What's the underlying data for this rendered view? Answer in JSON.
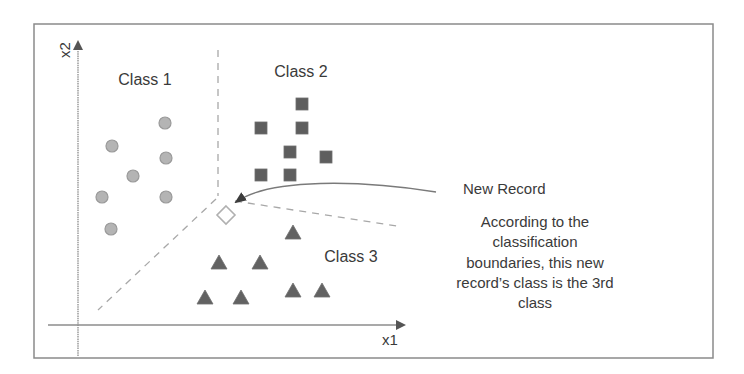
{
  "figure": {
    "type": "classification-scatter-diagram",
    "axes": {
      "x_label": "x1",
      "y_label": "x2"
    },
    "labels": {
      "class1": "Class 1",
      "class2": "Class 2",
      "class3": "Class 3",
      "new_record": "New Record"
    },
    "annotation_lines": [
      "According to the",
      "classification",
      "boundaries, this new",
      "record’s class is the 3rd",
      "class"
    ],
    "colors": {
      "frame": "#8a8a8a",
      "axis": "#8c8c8c",
      "boundary": "#a8a8a8",
      "class1_fill": "#b4b4b4",
      "class1_stroke": "#9a9a9a",
      "class2_fill": "#5e5e5e",
      "class3_fill": "#626262",
      "new_record_stroke": "#b0b0b0",
      "text": "#3a3a3a"
    },
    "points": {
      "class1_circles": [
        [
          165,
          123
        ],
        [
          112,
          146
        ],
        [
          166,
          158
        ],
        [
          133,
          176
        ],
        [
          102,
          197
        ],
        [
          166,
          197
        ],
        [
          111,
          229
        ]
      ],
      "class2_squares": [
        [
          302,
          104
        ],
        [
          261,
          128
        ],
        [
          302,
          128
        ],
        [
          290,
          152
        ],
        [
          326,
          157
        ],
        [
          261,
          175
        ],
        [
          290,
          175
        ]
      ],
      "class3_triangles": [
        [
          293,
          233
        ],
        [
          219,
          263
        ],
        [
          260,
          263
        ],
        [
          205,
          298
        ],
        [
          241,
          298
        ],
        [
          293,
          291
        ],
        [
          322,
          291
        ]
      ],
      "new_record_diamond": [
        226,
        215
      ]
    }
  }
}
